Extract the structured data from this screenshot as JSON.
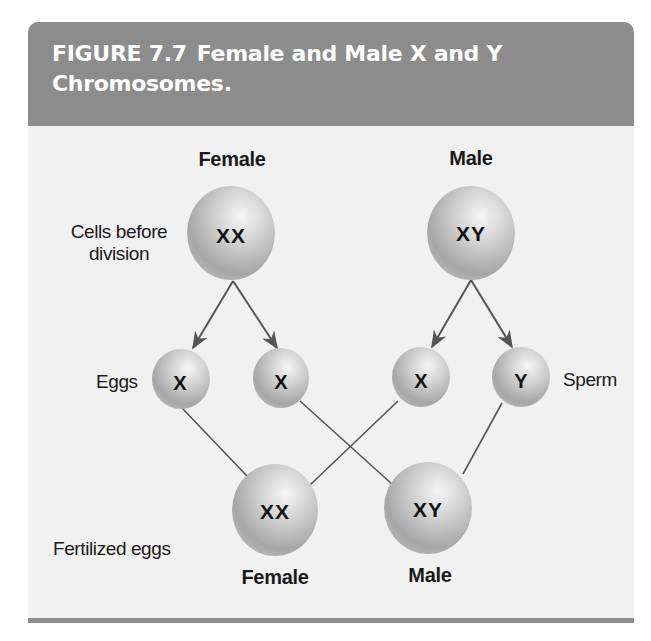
{
  "figure": {
    "number": "FIGURE 7.7",
    "title_line1": "Female and Male X and Y",
    "title_line2": "Chromosomes.",
    "colors": {
      "header_bg": "#8c8c8c",
      "body_bg": "#f1f1f1",
      "rule": "#8e8e8e",
      "line": "#555555",
      "cell_light": "#f4f4f4",
      "cell_dark": "#9a9a9a"
    }
  },
  "diagram": {
    "parents": {
      "female_label": "Female",
      "male_label": "Male",
      "female_cell": "XX",
      "male_cell": "XY"
    },
    "row_labels": {
      "cells_before_line1": "Cells before",
      "cells_before_line2": "division",
      "eggs": "Eggs",
      "sperm": "Sperm",
      "fertilized": "Fertilized eggs"
    },
    "gametes": {
      "egg1": "X",
      "egg2": "X",
      "sperm1": "X",
      "sperm2": "Y"
    },
    "offspring": {
      "female_cell": "XX",
      "male_cell": "XY",
      "female_label": "Female",
      "male_label": "Male"
    }
  }
}
